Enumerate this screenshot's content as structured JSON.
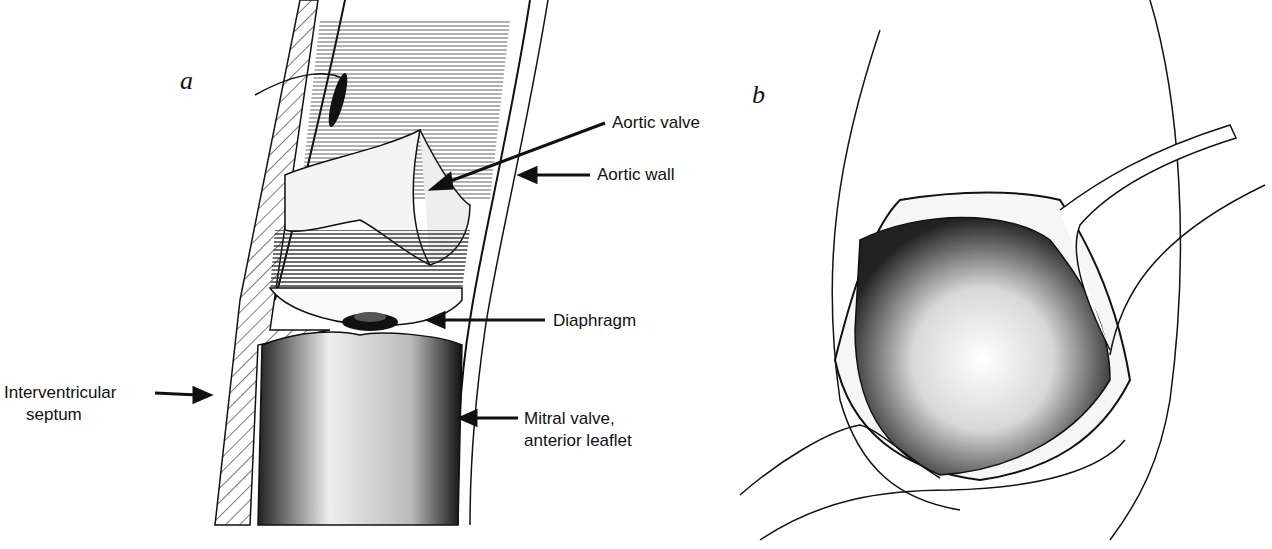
{
  "figure": {
    "panel_a": {
      "letter": "a",
      "labels": {
        "aortic_valve": "Aortic valve",
        "aortic_wall": "Aortic wall",
        "diaphragm": "Diaphragm",
        "septum_line1": "Interventricular",
        "septum_line2": "septum",
        "mitral_line1": "Mitral valve,",
        "mitral_line2": "anterior leaflet"
      }
    },
    "panel_b": {
      "letter": "b"
    }
  }
}
